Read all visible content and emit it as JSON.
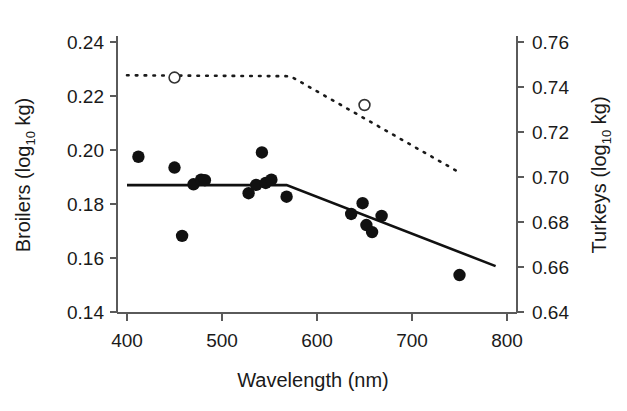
{
  "chart_data": {
    "type": "scatter",
    "title": "",
    "xlabel": "Wavelength (nm)",
    "ylabel_left": "Broilers  (log10 kg)",
    "ylabel_left_main": "Broilers  (log",
    "ylabel_left_sub": "10",
    "ylabel_left_tail": " kg)",
    "ylabel_right": "Turkeys (log10 kg)",
    "ylabel_right_main": "Turkeys (log",
    "ylabel_right_sub": "10",
    "ylabel_right_tail": " kg)",
    "xlim": [
      375,
      815
    ],
    "ylim_left": [
      0.14,
      0.24
    ],
    "ylim_right": [
      0.64,
      0.76
    ],
    "xticks": [
      400,
      500,
      600,
      700,
      800
    ],
    "xtick_labels": [
      "400",
      "500",
      "600",
      "700",
      "800"
    ],
    "yticks_left": [
      0.14,
      0.16,
      0.18,
      0.2,
      0.22,
      0.24
    ],
    "ytick_labels_left": [
      "0.14",
      "0.16",
      "0.18",
      "0.20",
      "0.22",
      "0.24"
    ],
    "yticks_right": [
      0.64,
      0.66,
      0.68,
      0.7,
      0.72,
      0.74,
      0.76
    ],
    "ytick_labels_right": [
      "0.64",
      "0.66",
      "0.68",
      "0.70",
      "0.72",
      "0.74",
      "0.76"
    ],
    "grid": false,
    "legend": "none",
    "series": [
      {
        "name": "Broilers",
        "axis": "left",
        "marker": "filled-circle",
        "color": "#111111",
        "x": [
          412,
          450,
          458,
          470,
          478,
          482,
          528,
          536,
          542,
          546,
          552,
          568,
          636,
          648,
          652,
          658,
          668,
          750
        ],
        "y": [
          0.1975,
          0.1935,
          0.1682,
          0.1873,
          0.189,
          0.1888,
          0.184,
          0.1871,
          0.1991,
          0.1878,
          0.189,
          0.1827,
          0.1763,
          0.1803,
          0.1722,
          0.1696,
          0.1756,
          0.1537
        ]
      },
      {
        "name": "Turkeys",
        "axis": "right",
        "marker": "open-circle",
        "color": "#333333",
        "x": [
          450,
          650
        ],
        "y": [
          0.7442,
          0.732
        ]
      }
    ],
    "fitted_lines": [
      {
        "name": "broilers-segmented-fit",
        "axis": "left",
        "style": "solid",
        "points": [
          [
            400,
            0.187
          ],
          [
            568,
            0.187
          ],
          [
            788,
            0.157
          ]
        ]
      },
      {
        "name": "turkeys-segmented-fit",
        "axis": "right",
        "style": "dotted",
        "points": [
          [
            400,
            0.7452
          ],
          [
            572,
            0.7448
          ],
          [
            750,
            0.702
          ]
        ]
      }
    ]
  },
  "figure": {
    "background_color": "#ffffff",
    "axis_color": "#5a5a5a",
    "data_color": "#111111"
  }
}
